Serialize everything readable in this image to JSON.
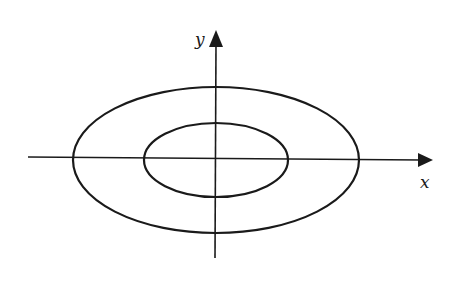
{
  "diagram": {
    "axes": {
      "x_label": "x",
      "y_label": "y",
      "origin": [
        216,
        158
      ],
      "x_axis": {
        "x1": 28,
        "y1": 157,
        "x2": 420,
        "y2": 160
      },
      "y_axis": {
        "x1": 215,
        "y1": 258,
        "x2": 216,
        "y2": 44
      }
    },
    "ellipses": [
      {
        "name": "outer-ellipse",
        "cx": 216,
        "cy": 160,
        "rx": 143,
        "ry": 73
      },
      {
        "name": "inner-ellipse",
        "cx": 216,
        "cy": 160,
        "rx": 72,
        "ry": 37
      }
    ],
    "colors": {
      "stroke": "#1a1a1a",
      "background": "#ffffff"
    }
  }
}
